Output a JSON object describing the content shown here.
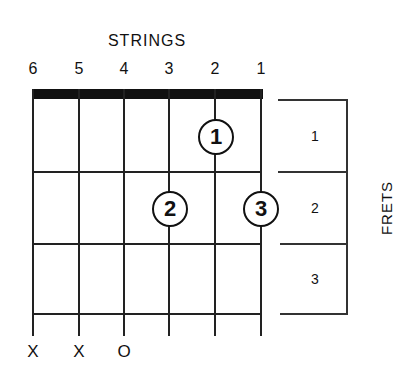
{
  "diagram": {
    "title": "STRINGS",
    "side_title": "FRETS",
    "strings": [
      {
        "label": "6",
        "x": 33,
        "marker": "X"
      },
      {
        "label": "5",
        "x": 79,
        "marker": "X"
      },
      {
        "label": "4",
        "x": 124,
        "marker": "O"
      },
      {
        "label": "3",
        "x": 169,
        "marker": ""
      },
      {
        "label": "2",
        "x": 215,
        "marker": ""
      },
      {
        "label": "1",
        "x": 261,
        "marker": ""
      }
    ],
    "fret_lines_y": [
      172,
      244,
      314
    ],
    "frets": [
      {
        "label": "1",
        "y": 136
      },
      {
        "label": "2",
        "y": 208
      },
      {
        "label": "3",
        "y": 279
      }
    ],
    "fingers": [
      {
        "label": "1",
        "string": "2",
        "fret": "1",
        "x": 215,
        "y": 136
      },
      {
        "label": "2",
        "string": "3",
        "fret": "2",
        "x": 169,
        "y": 208
      },
      {
        "label": "3",
        "string": "1",
        "fret": "2",
        "x": 260,
        "y": 208
      }
    ]
  }
}
